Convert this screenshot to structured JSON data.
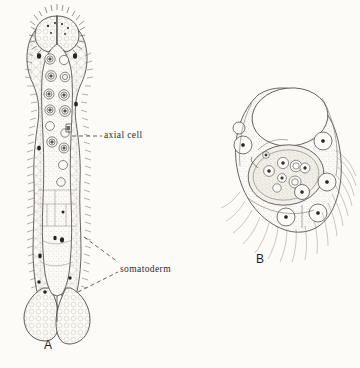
{
  "figure": {
    "background_color": "#fcfbf8",
    "ink_color": "#3a3a3a",
    "panels": [
      {
        "id": "A",
        "label": "A",
        "description": "elongate vermiform nematogen with ciliated calotte, axial cell and two basal lobes"
      },
      {
        "id": "B",
        "label": "B",
        "description": "infusoriform larva, lateral view with inner cell mass and trailing cilia"
      }
    ]
  },
  "annotations": [
    {
      "name": "axial-cell",
      "text": "axial cell",
      "leader": "dashed"
    },
    {
      "name": "somatoderm",
      "text": "somatoderm",
      "leader": "dashed-branched"
    }
  ]
}
